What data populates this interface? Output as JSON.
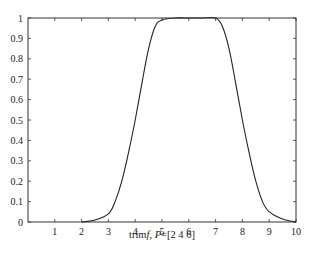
{
  "chart_data": {
    "type": "line",
    "title": "",
    "xlabel": "trimf, P=[2 4 6]",
    "ylabel": "",
    "xlim": [
      0,
      10
    ],
    "ylim": [
      0,
      1
    ],
    "x_ticks": [
      1,
      2,
      3,
      4,
      5,
      6,
      7,
      8,
      9,
      10
    ],
    "y_ticks": [
      0,
      0.1,
      0.2,
      0.3,
      0.4,
      0.5,
      0.6,
      0.7,
      0.8,
      0.9,
      1
    ],
    "grid": false,
    "legend": null,
    "series": [
      {
        "name": "membership",
        "color": "#222222",
        "x": [
          2,
          2.5,
          3,
          3.25,
          3.5,
          3.75,
          4,
          4.25,
          4.5,
          4.75,
          5,
          5.5,
          6,
          6.5,
          7,
          7.25,
          7.5,
          7.75,
          8,
          8.25,
          8.5,
          8.75,
          9,
          9.5,
          10
        ],
        "y": [
          0,
          0.01,
          0.04,
          0.1,
          0.2,
          0.34,
          0.5,
          0.68,
          0.85,
          0.96,
          0.99,
          1.0,
          1.0,
          1.0,
          1.0,
          0.96,
          0.85,
          0.68,
          0.5,
          0.34,
          0.2,
          0.1,
          0.05,
          0.015,
          0
        ]
      }
    ]
  },
  "plot": {
    "x_tick_labels": [
      "1",
      "2",
      "3",
      "4",
      "5",
      "6",
      "7",
      "8",
      "9",
      "10"
    ],
    "y_tick_labels": [
      "0",
      "0.1",
      "0.2",
      "0.3",
      "0.4",
      "0.5",
      "0.6",
      "0.7",
      "0.8",
      "0.9",
      "1"
    ],
    "xlabel_prefix": "trim",
    "xlabel_italic": "f",
    "xlabel_mid": ", ",
    "xlabel_param": "P",
    "xlabel_suffix": "=[2  4  6]"
  }
}
